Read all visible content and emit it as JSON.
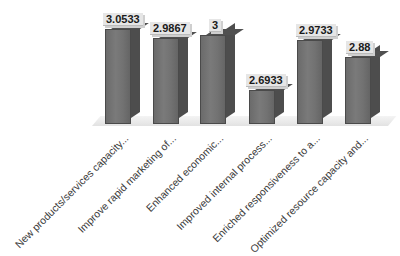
{
  "chart_data": {
    "type": "bar",
    "style": "3d-column",
    "title": "",
    "xlabel": "",
    "ylabel": "",
    "grid": false,
    "legend": null,
    "categories": [
      "New products/services capacity...",
      "Improve rapid marketing of...",
      "Enhanced economic...",
      "Improved internal process...",
      "Enriched responsiveness to a...",
      "Optimized resource capacity and..."
    ],
    "values": [
      3.0533,
      2.9867,
      3,
      2.6933,
      2.9733,
      2.88
    ],
    "data_labels": [
      "3.0533",
      "2.9867",
      "3",
      "2.6933",
      "2.9733",
      "2.88"
    ],
    "bar_color": "#6f6f6f"
  },
  "layout": {
    "baseline_y": 124,
    "bars": [
      {
        "x": 105,
        "top": 29,
        "w": 26,
        "label_x": 103,
        "label_y": 13
      },
      {
        "x": 153,
        "top": 38,
        "w": 26,
        "label_x": 150,
        "label_y": 22
      },
      {
        "x": 200,
        "top": 35,
        "w": 26,
        "label_x": 209,
        "label_y": 19
      },
      {
        "x": 249,
        "top": 90,
        "w": 26,
        "label_x": 246,
        "label_y": 74
      },
      {
        "x": 297,
        "top": 40,
        "w": 26,
        "label_x": 296,
        "label_y": 24
      },
      {
        "x": 345,
        "top": 57,
        "w": 26,
        "label_x": 346,
        "label_y": 41
      }
    ]
  }
}
